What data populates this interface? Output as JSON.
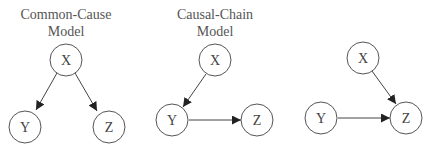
{
  "diagrams": [
    {
      "title_line1": "Common-Cause",
      "title_line2": "Model",
      "nodes": {
        "x": "X",
        "y": "Y",
        "z": "Z"
      },
      "edges": [
        "X→Y",
        "X→Z"
      ]
    },
    {
      "title_line1": "Causal-Chain",
      "title_line2": "Model",
      "nodes": {
        "x": "X",
        "y": "Y",
        "z": "Z"
      },
      "edges": [
        "X→Y",
        "Y→Z"
      ]
    },
    {
      "title_line1": "",
      "title_line2": "",
      "nodes": {
        "x": "X",
        "y": "Y",
        "z": "Z"
      },
      "edges": [
        "X→Z",
        "Y→Z"
      ]
    }
  ]
}
